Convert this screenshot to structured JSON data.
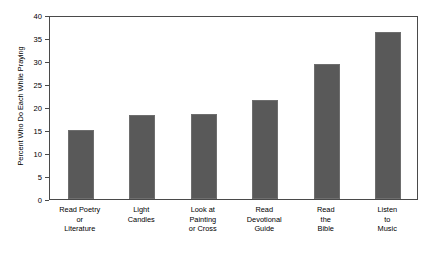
{
  "chart_data": {
    "type": "bar",
    "title": "",
    "xlabel": "",
    "ylabel": "Percent Who Do Each While Praying",
    "ylim": [
      0,
      40
    ],
    "yticks": [
      0,
      5,
      10,
      15,
      20,
      25,
      30,
      35,
      40
    ],
    "grid": false,
    "legend": null,
    "bar_color": "#595959",
    "frame_color": "#4a4a4a",
    "background": "#ffffff",
    "categories": [
      "Read Poetry\nor\nLiterature",
      "Light\nCandles",
      "Look at\nPainting\nor Cross",
      "Read\nDevotional\nGuide",
      "Read\nthe\nBible",
      "Listen\nto\nMusic"
    ],
    "values": [
      15.0,
      18.2,
      18.4,
      21.5,
      29.4,
      36.2
    ]
  }
}
